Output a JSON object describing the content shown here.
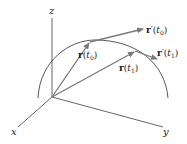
{
  "diagram": {
    "type": "3d-vector-curve",
    "axes": {
      "x": {
        "label": "x"
      },
      "y": {
        "label": "y"
      },
      "z": {
        "label": "z"
      }
    },
    "curve": {
      "label": ""
    },
    "vectors": [
      {
        "id": "r_t0",
        "bold": "r",
        "arg": "t",
        "sub": "0",
        "prime": ""
      },
      {
        "id": "r_t1",
        "bold": "r",
        "arg": "t",
        "sub": "1",
        "prime": ""
      },
      {
        "id": "rprime_t0",
        "bold": "r",
        "arg": "t",
        "sub": "0",
        "prime": "′"
      },
      {
        "id": "rprime_t1",
        "bold": "r",
        "arg": "t",
        "sub": "1",
        "prime": "′"
      }
    ],
    "punct": {
      "open": "(",
      "close": ")"
    },
    "colors": {
      "axis": "#555555",
      "curve": "#444444",
      "vector": "#7a7a7a",
      "text": "#222222"
    }
  }
}
